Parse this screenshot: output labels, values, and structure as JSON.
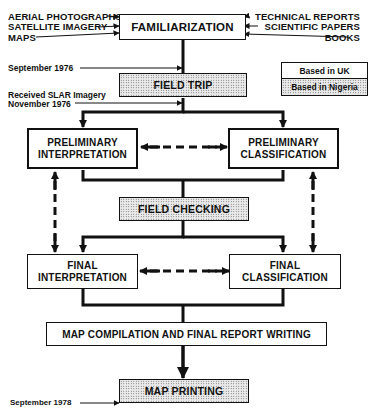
{
  "diagram": {
    "inputs_left": [
      {
        "label": "AERIAL PHOTOGRAPHS"
      },
      {
        "label": "SATELLITE IMAGERY"
      },
      {
        "label": "MAPS"
      }
    ],
    "inputs_right": [
      {
        "label": "TECHNICAL REPORTS"
      },
      {
        "label": "SCIENTIFIC PAPERS"
      },
      {
        "label": "BOOKS"
      }
    ],
    "steps": {
      "familiarization": "FAMILIARIZATION",
      "field_trip": "FIELD TRIP",
      "preliminary_interpretation": [
        "PRELIMINARY",
        "INTERPRETATION"
      ],
      "preliminary_classification": [
        "PRELIMINARY",
        "CLASSIFICATION"
      ],
      "field_checking": "FIELD CHECKING",
      "final_interpretation": [
        "FINAL",
        "INTERPRETATION"
      ],
      "final_classification": [
        "FINAL",
        "CLASSIFICATION"
      ],
      "map_compilation": "MAP COMPILATION AND FINAL REPORT WRITING",
      "map_printing": "MAP PRINTING"
    },
    "annotations": {
      "september_1976": "September 1976",
      "slar_line1": "Received SLAR Imagery",
      "slar_line2": "November 1976",
      "september_1978": "September 1978"
    },
    "legend": {
      "uk": "Based in UK",
      "nigeria": "Based in Nigeria"
    },
    "colors": {
      "line": "#111111",
      "background": "#ffffff",
      "dotted_fill": "#e9e9e9"
    }
  }
}
